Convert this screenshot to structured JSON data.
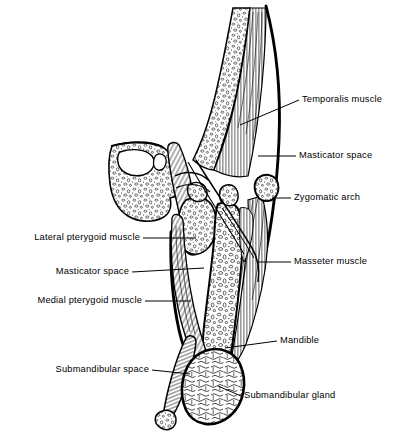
{
  "figure": {
    "style": "black-and-white line drawing",
    "background_color": "#ffffff",
    "line_color": "#000000",
    "width": 402,
    "height": 435
  },
  "labels": {
    "temporalis_muscle": "Temporalis muscle",
    "masticator_space_right": "Masticator space",
    "zygomatic_arch": "Zygomatic arch",
    "masseter_muscle": "Masseter muscle",
    "mandible": "Mandible",
    "submandibular_gland": "Submandibular gland",
    "lateral_pterygoid_muscle": "Lateral pterygoid muscle",
    "masticator_space_left": "Masticator space",
    "medial_pterygoid_muscle": "Medial pterygoid muscle",
    "submandibular_space": "Submandibular space"
  },
  "structures": [
    {
      "name": "skull-base-bone",
      "texture": "trabecular stipple"
    },
    {
      "name": "temporalis-muscle",
      "texture": "fine parallel fibers"
    },
    {
      "name": "masticator-space-fascia",
      "texture": "thick outline"
    },
    {
      "name": "zygomatic-arch",
      "texture": "stippled oval"
    },
    {
      "name": "masseter-muscle",
      "texture": "fine parallel fibers"
    },
    {
      "name": "mandible-ramus",
      "texture": "trabecular stipple"
    },
    {
      "name": "medial-pterygoid-muscle",
      "texture": "fine parallel fibers"
    },
    {
      "name": "lateral-pterygoid-muscle",
      "texture": "trabecular stipple"
    },
    {
      "name": "submandibular-gland",
      "texture": "lobular mottle"
    },
    {
      "name": "submandibular-space",
      "texture": "hatched band"
    },
    {
      "name": "hyoid-fragment",
      "texture": "stippled oval"
    }
  ]
}
